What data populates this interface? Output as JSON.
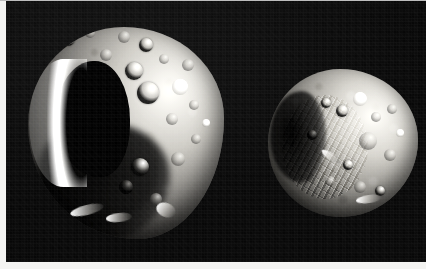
{
  "image": {
    "kind": "astronomical-photograph",
    "medium": "grayscale photographic print",
    "background_color": "#0a0a0a",
    "border_color": "#f4f4f2",
    "width_px": 426,
    "height_px": 269,
    "caption": "Two irregular cratered moons photographed against black space",
    "alt_text": "Grayscale photograph of two small heavily cratered irregular moons on a black background; the larger body at left has a prominent dark shadowed basin, the smaller body at right is rounder with rugged chaotic terrain."
  },
  "bodies": [
    {
      "id": "moon-left",
      "name": "Larger moon",
      "position": "left",
      "relative_size": "large",
      "shape": "irregular, slightly elongated",
      "notable_features": [
        "large dark shadowed basin on the left limb",
        "bright illuminated crescent rim along the left edge",
        "several bowl-shaped craters with bright rims and dark floors",
        "heavily shadowed lower-left terminator",
        "bright elongated ridge near the bottom edge"
      ]
    },
    {
      "id": "moon-right",
      "name": "Smaller moon",
      "position": "right",
      "relative_size": "small",
      "shape": "rounded, slightly faceted",
      "notable_features": [
        "rugged chaotic ridged terrain across the left half",
        "dark shadowed left flank",
        "bright smooth upper-right limb",
        "cluster of small craters near the center and upper right"
      ]
    }
  ],
  "craters_left": [
    {
      "cx": 40,
      "cy": 12,
      "r": 7,
      "style": "crater-bowl"
    },
    {
      "cx": 62,
      "cy": 6,
      "r": 5,
      "style": "crater-shallow"
    },
    {
      "cx": 96,
      "cy": 10,
      "r": 6,
      "style": "crater-shallow"
    },
    {
      "cx": 118,
      "cy": 18,
      "r": 7,
      "style": "crater-bowl"
    },
    {
      "cx": 136,
      "cy": 32,
      "r": 5,
      "style": "crater-shallow"
    },
    {
      "cx": 106,
      "cy": 44,
      "r": 9,
      "style": "crater-bowl"
    },
    {
      "cx": 120,
      "cy": 66,
      "r": 11,
      "style": "crater-bowl"
    },
    {
      "cx": 152,
      "cy": 60,
      "r": 8,
      "style": "crater-bright"
    },
    {
      "cx": 166,
      "cy": 78,
      "r": 5,
      "style": "crater-shallow"
    },
    {
      "cx": 144,
      "cy": 92,
      "r": 6,
      "style": "crater-shallow"
    },
    {
      "cx": 168,
      "cy": 112,
      "r": 5,
      "style": "crater-shallow"
    },
    {
      "cx": 150,
      "cy": 132,
      "r": 7,
      "style": "crater-shallow"
    },
    {
      "cx": 112,
      "cy": 140,
      "r": 9,
      "style": "crater-bowl"
    },
    {
      "cx": 98,
      "cy": 160,
      "r": 7,
      "style": "crater-dark"
    },
    {
      "cx": 128,
      "cy": 172,
      "r": 6,
      "style": "crater-shallow"
    },
    {
      "cx": 78,
      "cy": 28,
      "r": 6,
      "style": "crater-shallow"
    },
    {
      "cx": 160,
      "cy": 38,
      "r": 6,
      "style": "crater-shallow"
    },
    {
      "cx": 178,
      "cy": 96,
      "r": 4,
      "style": "crater-bright"
    }
  ],
  "craters_right": [
    {
      "cx": 92,
      "cy": 30,
      "r": 7,
      "style": "crater-bright"
    },
    {
      "cx": 74,
      "cy": 42,
      "r": 6,
      "style": "crater-bowl"
    },
    {
      "cx": 108,
      "cy": 48,
      "r": 5,
      "style": "crater-shallow"
    },
    {
      "cx": 124,
      "cy": 40,
      "r": 5,
      "style": "crater-shallow"
    },
    {
      "cx": 58,
      "cy": 34,
      "r": 5,
      "style": "crater-bowl"
    },
    {
      "cx": 100,
      "cy": 72,
      "r": 9,
      "style": "crater-shallow"
    },
    {
      "cx": 122,
      "cy": 86,
      "r": 6,
      "style": "crater-shallow"
    },
    {
      "cx": 80,
      "cy": 96,
      "r": 5,
      "style": "crater-bowl"
    },
    {
      "cx": 62,
      "cy": 112,
      "r": 5,
      "style": "crater-shallow"
    },
    {
      "cx": 92,
      "cy": 118,
      "r": 6,
      "style": "crater-shallow"
    },
    {
      "cx": 112,
      "cy": 122,
      "r": 5,
      "style": "crater-bowl"
    },
    {
      "cx": 44,
      "cy": 66,
      "r": 5,
      "style": "crater-dark"
    },
    {
      "cx": 132,
      "cy": 64,
      "r": 4,
      "style": "crater-bright"
    }
  ],
  "ridges_left": [
    {
      "x": 42,
      "y": 178,
      "w": 34,
      "h": 10,
      "rot": -14
    },
    {
      "x": 78,
      "y": 186,
      "w": 26,
      "h": 9,
      "rot": -6
    },
    {
      "x": 128,
      "y": 176,
      "w": 20,
      "h": 14,
      "rot": 22
    }
  ],
  "ridges_right": [
    {
      "x": 88,
      "y": 126,
      "w": 26,
      "h": 8,
      "rot": -8
    },
    {
      "x": 52,
      "y": 84,
      "w": 22,
      "h": 7,
      "rot": 34
    }
  ]
}
